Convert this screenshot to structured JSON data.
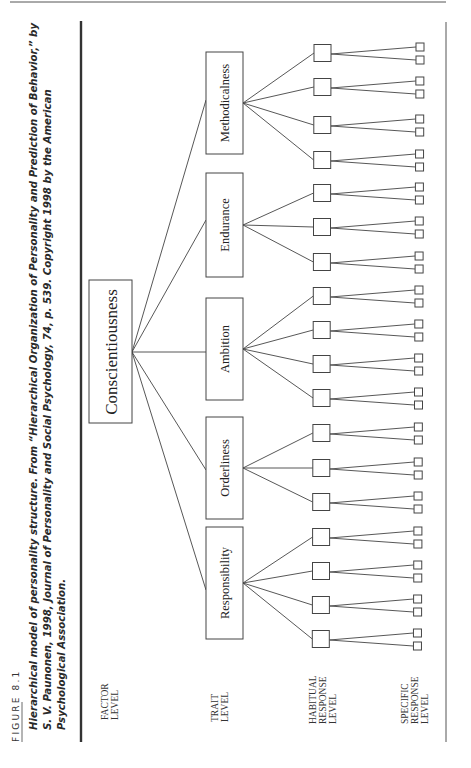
{
  "figure": {
    "label": "FIGURE 8.1",
    "caption_lines": [
      "Hierarchical model of personality structure. From “Hierarchical Organization of Personality and Prediction of Behavior,” by",
      "S. V. Paunonen, 1998, Journal of Personality and Social Psychology, 74, p. 539. Copyright 1998 by the American",
      "Psychological Association."
    ]
  },
  "levels": {
    "factor": [
      "FACTOR",
      "LEVEL"
    ],
    "trait": [
      "TRAIT",
      "LEVEL"
    ],
    "habitual": [
      "HABITUAL",
      "RESPONSE",
      "LEVEL"
    ],
    "specific": [
      "SPECIFIC",
      "RESPONSE",
      "LEVEL"
    ]
  },
  "factor": {
    "label": "Conscientiousness"
  },
  "traits": [
    {
      "label": "Methodicalness",
      "habitual_count": 4
    },
    {
      "label": "Endurance",
      "habitual_count": 3
    },
    {
      "label": "Ambition",
      "habitual_count": 4
    },
    {
      "label": "Orderliness",
      "habitual_count": 3
    },
    {
      "label": "Responsibility",
      "habitual_count": 4
    }
  ],
  "specific_per_habitual": 2
}
